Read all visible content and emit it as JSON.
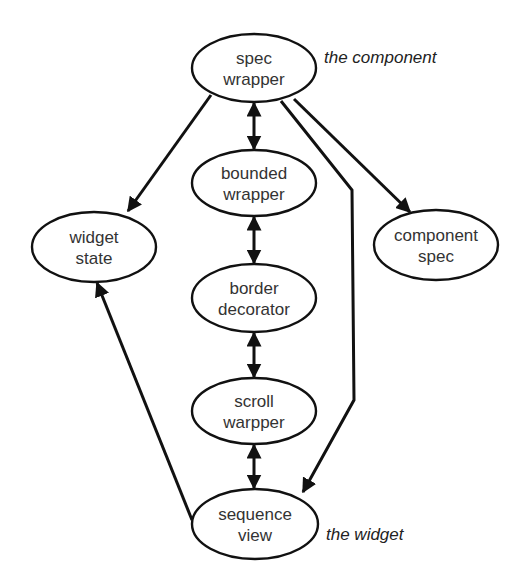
{
  "diagram": {
    "type": "directed-graph",
    "nodes": [
      {
        "id": "spec_wrapper",
        "lines": [
          "spec",
          "wrapper"
        ],
        "cx": 254,
        "cy": 68,
        "rx": 62,
        "ry": 34
      },
      {
        "id": "bounded_wrapper",
        "lines": [
          "bounded",
          "wrapper"
        ],
        "cx": 254,
        "cy": 183,
        "rx": 62,
        "ry": 33
      },
      {
        "id": "border_decorator",
        "lines": [
          "border",
          "decorator"
        ],
        "cx": 254,
        "cy": 298,
        "rx": 62,
        "ry": 34
      },
      {
        "id": "scroll_warpper",
        "lines": [
          "scroll",
          "warpper"
        ],
        "cx": 254,
        "cy": 411,
        "rx": 62,
        "ry": 33
      },
      {
        "id": "sequence_view",
        "lines": [
          "sequence",
          "view"
        ],
        "cx": 255,
        "cy": 524,
        "rx": 63,
        "ry": 35
      },
      {
        "id": "widget_state",
        "lines": [
          "widget",
          "state"
        ],
        "cx": 94,
        "cy": 247,
        "rx": 62,
        "ry": 35
      },
      {
        "id": "component_spec",
        "lines": [
          "component",
          "spec"
        ],
        "cx": 436,
        "cy": 245,
        "rx": 62,
        "ry": 35
      }
    ],
    "edges": [
      {
        "from": "spec_wrapper",
        "to": "widget_state",
        "arrow": "end",
        "points": [
          [
            211,
            95
          ],
          [
            128,
            211
          ]
        ]
      },
      {
        "from": "spec_wrapper",
        "to": "component_spec",
        "arrow": "end",
        "points": [
          [
            294,
            99
          ],
          [
            410,
            212
          ]
        ]
      },
      {
        "from": "spec_wrapper",
        "to": "sequence_view",
        "arrow": "end",
        "points": [
          [
            281,
            101
          ],
          [
            352,
            190
          ],
          [
            354,
            400
          ],
          [
            303,
            492
          ]
        ]
      },
      {
        "from": "spec_wrapper",
        "to": "bounded_wrapper",
        "arrow": "both",
        "points": [
          [
            254,
            103
          ],
          [
            254,
            149
          ]
        ]
      },
      {
        "from": "bounded_wrapper",
        "to": "border_decorator",
        "arrow": "both",
        "points": [
          [
            254,
            217
          ],
          [
            254,
            263
          ]
        ]
      },
      {
        "from": "border_decorator",
        "to": "scroll_warpper",
        "arrow": "both",
        "points": [
          [
            254,
            333
          ],
          [
            254,
            377
          ]
        ]
      },
      {
        "from": "scroll_warpper",
        "to": "sequence_view",
        "arrow": "both",
        "points": [
          [
            254,
            445
          ],
          [
            254,
            488
          ]
        ]
      },
      {
        "from": "sequence_view",
        "to": "widget_state",
        "arrow": "end",
        "points": [
          [
            192,
            520
          ],
          [
            97,
            283
          ]
        ]
      }
    ],
    "annotations": [
      {
        "id": "component_label",
        "text": "the component",
        "x": 324,
        "y": 63
      },
      {
        "id": "widget_label",
        "text": "the widget",
        "x": 326,
        "y": 540
      }
    ]
  }
}
